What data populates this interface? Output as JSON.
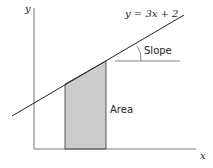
{
  "diagram": {
    "equation_label": "y = 3x + 2",
    "slope_label": "Slope",
    "area_label": "Area",
    "x_axis_label": "x",
    "y_axis_label": "y",
    "colors": {
      "line": "#222222",
      "area_fill": "#cccccc",
      "axis": "#555555"
    }
  }
}
